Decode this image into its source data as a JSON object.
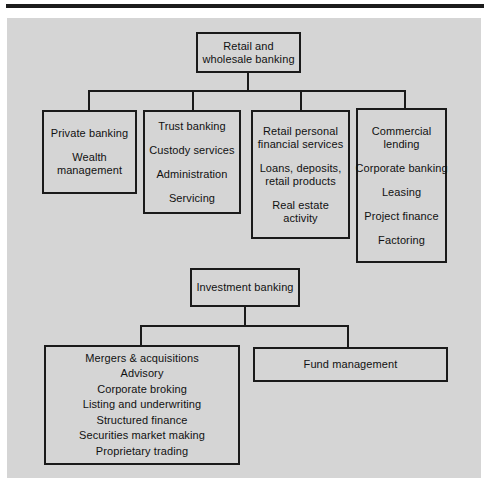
{
  "page": {
    "background_color": "#ffffff",
    "panel_color": "#d5d5d5",
    "rule_color": "#1c1c1c",
    "line_color": "#1a1a1a",
    "text_color": "#111111"
  },
  "diagram": {
    "type": "organizational-hierarchy",
    "trees": [
      {
        "id": "retail-and-wholesale-banking",
        "root": {
          "id": "root-retail",
          "groups": [
            {
              "lines": [
                "Retail and",
                "wholesale banking"
              ]
            }
          ]
        },
        "children": [
          {
            "id": "private-banking",
            "groups": [
              {
                "lines": [
                  "Private banking"
                ]
              },
              {
                "lines": [
                  "Wealth",
                  "management"
                ]
              }
            ]
          },
          {
            "id": "trust-banking",
            "groups": [
              {
                "lines": [
                  "Trust banking"
                ]
              },
              {
                "lines": [
                  "Custody services"
                ]
              },
              {
                "lines": [
                  "Administration"
                ]
              },
              {
                "lines": [
                  "Servicing"
                ]
              }
            ]
          },
          {
            "id": "retail-personal-financial-services",
            "groups": [
              {
                "lines": [
                  "Retail personal",
                  "financial services"
                ]
              },
              {
                "lines": [
                  "Loans, deposits,",
                  "retail products"
                ]
              },
              {
                "lines": [
                  "Real estate",
                  "activity"
                ]
              }
            ]
          },
          {
            "id": "commercial-lending",
            "groups": [
              {
                "lines": [
                  "Commercial",
                  "lending"
                ]
              },
              {
                "lines": [
                  "Corporate banking"
                ]
              },
              {
                "lines": [
                  "Leasing"
                ]
              },
              {
                "lines": [
                  "Project finance"
                ]
              },
              {
                "lines": [
                  "Factoring"
                ]
              }
            ]
          }
        ]
      },
      {
        "id": "investment-banking",
        "root": {
          "id": "root-investment",
          "groups": [
            {
              "lines": [
                "Investment banking"
              ]
            }
          ]
        },
        "children": [
          {
            "id": "investment-banking-activities",
            "groups": [
              {
                "lines": [
                  "Mergers & acquisitions"
                ]
              },
              {
                "lines": [
                  "Advisory"
                ]
              },
              {
                "lines": [
                  "Corporate broking"
                ]
              },
              {
                "lines": [
                  "Listing and underwriting"
                ]
              },
              {
                "lines": [
                  "Structured finance"
                ]
              },
              {
                "lines": [
                  "Securities market making"
                ]
              },
              {
                "lines": [
                  "Proprietary trading"
                ]
              }
            ]
          },
          {
            "id": "fund-management",
            "groups": [
              {
                "lines": [
                  "Fund management"
                ]
              }
            ]
          }
        ]
      }
    ]
  },
  "nodes": {
    "root_retail": {
      "l1": "Retail and",
      "l2": "wholesale banking"
    },
    "private_banking": {
      "l1": "Private banking",
      "l2": "Wealth",
      "l3": "management"
    },
    "trust_banking": {
      "l1": "Trust banking",
      "l2": "Custody services",
      "l3": "Administration",
      "l4": "Servicing"
    },
    "retail_personal": {
      "l1": "Retail personal",
      "l2": "financial services",
      "l3": "Loans, deposits,",
      "l4": "retail products",
      "l5": "Real estate",
      "l6": "activity"
    },
    "commercial_lending": {
      "l1": "Commercial",
      "l2": "lending",
      "l3": "Corporate banking",
      "l4": "Leasing",
      "l5": "Project finance",
      "l6": "Factoring"
    },
    "root_investment": {
      "l1": "Investment banking"
    },
    "ib_activities": {
      "l1": "Mergers & acquisitions",
      "l2": "Advisory",
      "l3": "Corporate broking",
      "l4": "Listing and underwriting",
      "l5": "Structured finance",
      "l6": "Securities market making",
      "l7": "Proprietary trading"
    },
    "fund_management": {
      "l1": "Fund management"
    }
  }
}
